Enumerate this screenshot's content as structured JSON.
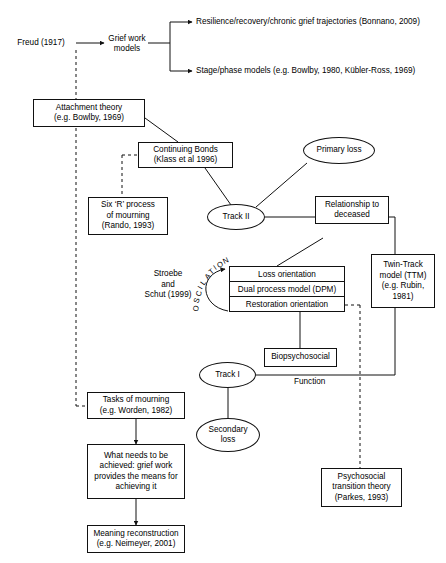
{
  "diagram": {
    "background_color": "#ffffff",
    "line_color": "#111111",
    "nodes": {
      "freud": {
        "label": "Freud (1917)",
        "shape": "plain"
      },
      "grief_work_models": {
        "label": "Grief work\nmodels",
        "shape": "plain"
      },
      "resilience": {
        "label": "Resilience/recovery/chronic grief trajectories (Bonnano, 2009)",
        "shape": "plain"
      },
      "stage_phase": {
        "label": "Stage/phase models (e.g. Bowlby, 1980, Kübler-Ross, 1969)",
        "shape": "plain"
      },
      "attachment_theory": {
        "label": "Attachment theory\n(e.g. Bowlby, 1969)",
        "shape": "box"
      },
      "continuing_bonds": {
        "label": "Continuing Bonds\n(Klass et al 1996)",
        "shape": "box"
      },
      "six_r_process": {
        "label": "Six ‘R’ process\nof mourning\n(Rando, 1993)",
        "shape": "box"
      },
      "primary_loss": {
        "label": "Primary loss",
        "shape": "ellipse"
      },
      "track_two": {
        "label": "Track II",
        "shape": "ellipse"
      },
      "relationship_to_deceased": {
        "label": "Relationship to\ndeceased",
        "shape": "box"
      },
      "twin_track_model": {
        "label": "Twin-Track\nmodel (TTM)\n(e.g. Rubin,\n1981)",
        "shape": "box"
      },
      "stroebe_schut": {
        "label": "Stroebe\nand\nSchut (1999)",
        "shape": "plain"
      },
      "dual_process_model": {
        "shape": "stacked-box",
        "rows": [
          "Loss orientation",
          "Dual process model (DPM)",
          "Restoration orientation"
        ]
      },
      "oscillation_label": {
        "label": "OSCILLATION"
      },
      "biopsychosocial": {
        "label": "Biopsychosocial",
        "shape": "box"
      },
      "track_one": {
        "label": "Track I",
        "shape": "ellipse"
      },
      "function_label": {
        "label": "Function"
      },
      "secondary_loss": {
        "label": "Secondary\nloss",
        "shape": "ellipse"
      },
      "tasks_of_mourning": {
        "label": "Tasks of mourning\n(e.g. Worden, 1982)",
        "shape": "box"
      },
      "what_needs_achieved": {
        "label": "What needs to be\nachieved: grief work\nprovides the means for\nachieving it",
        "shape": "box"
      },
      "meaning_reconstruction": {
        "label": "Meaning reconstruction\n(e.g. Neimeyer, 2001)",
        "shape": "box"
      },
      "psychosocial_transition": {
        "label": "Psychosocial\ntransition theory\n(Parkes, 1993)",
        "shape": "box"
      }
    }
  }
}
